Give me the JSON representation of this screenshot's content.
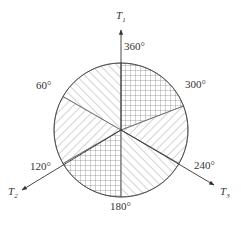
{
  "diagram": {
    "type": "phase sector diagram",
    "axes": [
      {
        "name": "T",
        "subscript": "1"
      },
      {
        "name": "T",
        "subscript": "2"
      },
      {
        "name": "T",
        "subscript": "3"
      }
    ],
    "angle_labels": [
      "360°",
      "300°",
      "240°",
      "180°",
      "120°",
      "60°"
    ],
    "sectors": [
      {
        "from": "360°",
        "to": "300°",
        "pattern": "crosshatch"
      },
      {
        "from": "300°",
        "to": "240°",
        "pattern": "diagonal-forward"
      },
      {
        "from": "240°",
        "to": "180°",
        "pattern": "diagonal-backward"
      },
      {
        "from": "180°",
        "to": "120°",
        "pattern": "crosshatch"
      },
      {
        "from": "120°",
        "to": "60°",
        "pattern": "diagonal-forward"
      },
      {
        "from": "60°",
        "to": "360°",
        "pattern": "diagonal-backward"
      }
    ],
    "colors": {
      "line": "#333333",
      "hatch": "#555555",
      "background": "#ffffff"
    }
  }
}
